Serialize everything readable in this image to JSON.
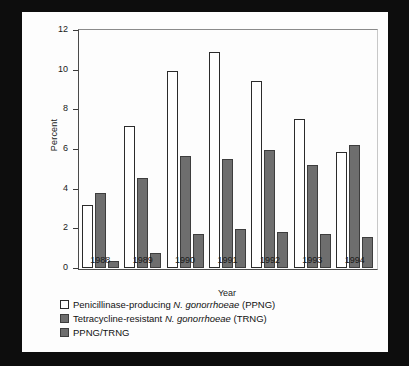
{
  "chart_data": {
    "type": "bar",
    "title": "",
    "xlabel": "Year",
    "ylabel": "Percent",
    "categories": [
      "1988",
      "1989",
      "1990",
      "1991",
      "1992",
      "1993",
      "1994"
    ],
    "ylim": [
      0,
      12
    ],
    "yticks": [
      0,
      2,
      4,
      6,
      8,
      10,
      12
    ],
    "ytick_labels": [
      "0",
      "2",
      "4",
      "6",
      "8",
      "10",
      "12"
    ],
    "grid": false,
    "legend_position": "below",
    "series": [
      {
        "name": "Penicillinase-producing N. gonorrhoeae (PPNG)",
        "short_name": "PPNG",
        "color": "#ffffff",
        "values": [
          3.2,
          7.15,
          9.95,
          10.9,
          9.45,
          7.5,
          5.85
        ]
      },
      {
        "name": "Tetracycline-resistant N. gonorrhoeae (TRNG)",
        "short_name": "TRNG",
        "color": "#6e6e6e",
        "values": [
          3.8,
          4.55,
          5.65,
          5.5,
          5.95,
          5.2,
          6.2
        ]
      },
      {
        "name": "PPNG/TRNG",
        "short_name": "PPNG/TRNG",
        "color": "#6e6e6e",
        "values": [
          0.35,
          0.75,
          1.7,
          1.95,
          1.8,
          1.7,
          1.55
        ]
      }
    ]
  },
  "legend": {
    "entries": [
      {
        "swatch": "white",
        "prefix": "Penicillinase-producing ",
        "italic": "N. gonorrhoeae",
        "suffix": " (PPNG)"
      },
      {
        "swatch": "gray",
        "prefix": "Tetracycline-resistant ",
        "italic": "N. gonorrhoeae",
        "suffix": " (TRNG)"
      },
      {
        "swatch": "gray",
        "prefix": "PPNG/TRNG",
        "italic": "",
        "suffix": ""
      }
    ]
  },
  "colors": {
    "background": "#0d0d0d",
    "panel": "#fdfdfd",
    "bar_white": "#ffffff",
    "bar_gray": "#6e6e6e",
    "axis": "#3a3a3a",
    "text": "#1a1a1a"
  }
}
